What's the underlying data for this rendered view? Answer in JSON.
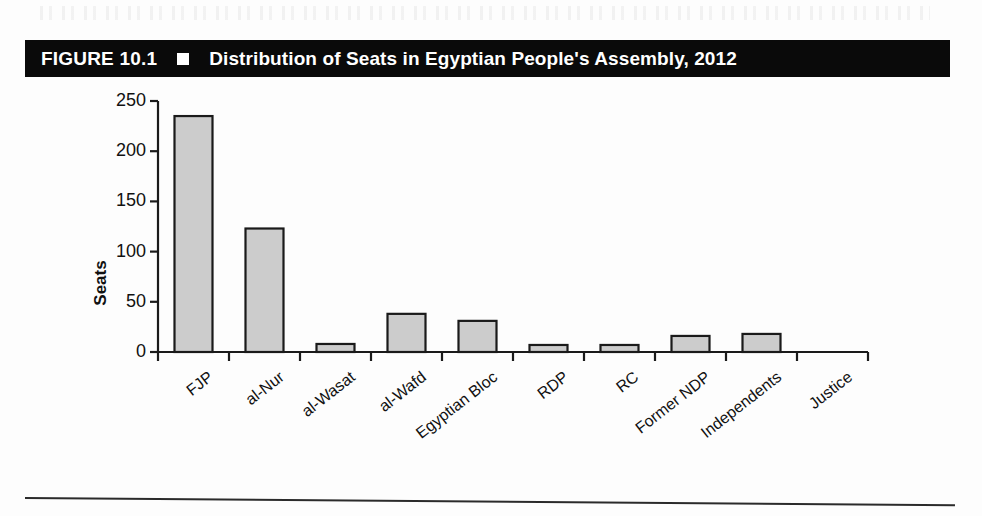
{
  "figure": {
    "number_label": "FIGURE 10.1",
    "marker_icon": "white-square-marker",
    "caption": "Distribution of Seats in Egyptian People's Assembly, 2012"
  },
  "chart_data": {
    "type": "bar",
    "title": "Distribution of Seats in Egyptian People's Assembly, 2012",
    "xlabel": "",
    "ylabel": "Seats",
    "ylim": [
      0,
      250
    ],
    "yticks": [
      0,
      50,
      100,
      150,
      200,
      250
    ],
    "ytick_labels": [
      "0",
      "50",
      "100",
      "150",
      "200",
      "250"
    ],
    "grid": false,
    "legend": "none",
    "categories": [
      "FJP",
      "al-Nur",
      "al-Wasat",
      "al-Wafd",
      "Egyptian Bloc",
      "RDP",
      "RC",
      "Former NDP",
      "Independents",
      "Justice"
    ],
    "values": [
      235,
      123,
      8,
      38,
      31,
      7,
      7,
      16,
      18,
      0
    ],
    "bar_fill_color": "#cccccc",
    "bar_edge_color": "#1a1a1a",
    "axis_color": "#1a1a1a"
  }
}
